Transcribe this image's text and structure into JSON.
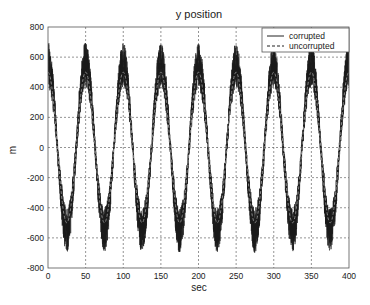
{
  "chart_data": {
    "type": "line",
    "title": "y position",
    "xlabel": "sec",
    "ylabel": "m",
    "xlim": [
      0,
      400
    ],
    "ylim": [
      -800,
      800
    ],
    "xticks": [
      0,
      50,
      100,
      150,
      200,
      250,
      300,
      350,
      400
    ],
    "yticks": [
      -800,
      -600,
      -400,
      -200,
      0,
      200,
      400,
      600,
      800
    ],
    "grid": true,
    "legend_position": "upper right",
    "series": [
      {
        "name": "corrupted",
        "style": "solid",
        "color": "#1a1a1a",
        "description": "noisy version of the reference signal",
        "amplitude": 500,
        "period": 50,
        "noise_peak_extremes": {
          "max": 720,
          "min": -730
        },
        "x": [
          0,
          25,
          50,
          75,
          100,
          125,
          150,
          175,
          200,
          225,
          250,
          275,
          300,
          325,
          350,
          375,
          400
        ],
        "values": [
          600,
          -650,
          680,
          -700,
          700,
          -680,
          690,
          -640,
          640,
          -720,
          600,
          -600,
          600,
          -600,
          620,
          -610,
          560
        ]
      },
      {
        "name": "uncorrupted",
        "style": "dashed",
        "color": "#1a1a1a",
        "amplitude": 500,
        "period": 50,
        "x": [
          0,
          25,
          50,
          75,
          100,
          125,
          150,
          175,
          200,
          225,
          250,
          275,
          300,
          325,
          350,
          375,
          400
        ],
        "values": [
          500,
          -500,
          500,
          -500,
          500,
          -500,
          500,
          -500,
          500,
          -500,
          500,
          -500,
          500,
          -500,
          500,
          -500,
          500
        ]
      }
    ]
  },
  "legend": {
    "items": [
      {
        "label": "corrupted",
        "style": "solid"
      },
      {
        "label": "uncorrupted",
        "style": "dashed"
      }
    ]
  }
}
